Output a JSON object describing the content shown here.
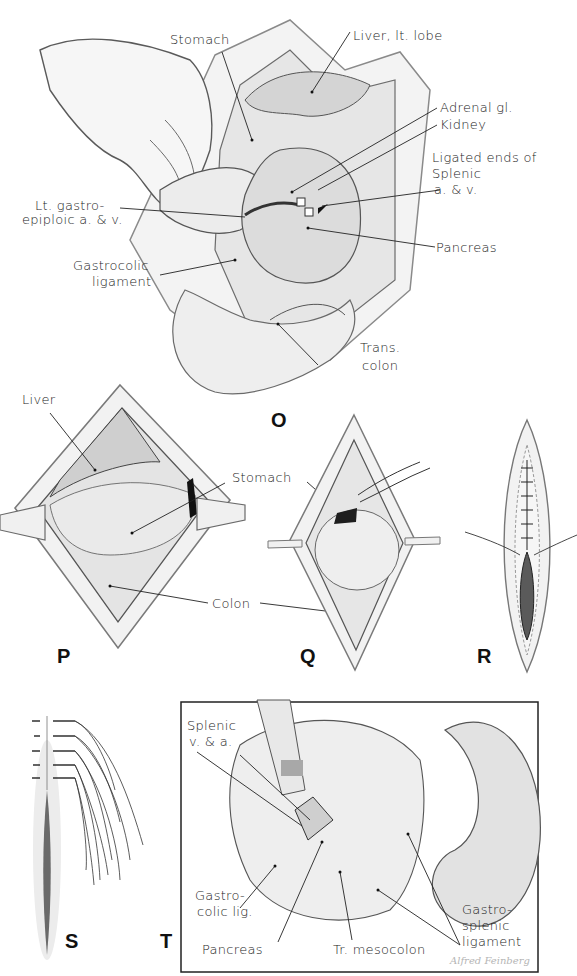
{
  "figure": {
    "panels": [
      {
        "id": "O",
        "letter": "O",
        "labels": {
          "stomach": "Stomach",
          "liver_lt_lobe": "Liver, lt. lobe",
          "adrenal_gl": "Adrenal gl.",
          "kidney": "Kidney",
          "ligated_ends_1": "Ligated ends of",
          "ligated_ends_2": "Splenic",
          "ligated_ends_3": "a. & v.",
          "lt_gastro_1": "Lt. gastro-",
          "lt_gastro_2": "epiploic a. & v.",
          "pancreas": "Pancreas",
          "gastrocolic_1": "Gastrocolic",
          "gastrocolic_2": "ligament",
          "trans_colon_1": "Trans.",
          "trans_colon_2": "colon"
        }
      },
      {
        "id": "P",
        "letter": "P",
        "labels": {
          "liver": "Liver",
          "stomach": "Stomach",
          "colon": "Colon"
        }
      },
      {
        "id": "Q",
        "letter": "Q"
      },
      {
        "id": "R",
        "letter": "R"
      },
      {
        "id": "S",
        "letter": "S"
      },
      {
        "id": "T",
        "letter": "T",
        "labels": {
          "splenic_1": "Splenic",
          "splenic_2": "v. & a.",
          "gastrocolic_1": "Gastro-",
          "gastrocolic_2": "colic lig.",
          "pancreas": "Pancreas",
          "tr_mesocolon": "Tr. mesocolon",
          "gastrosplenic_1": "Gastro-",
          "gastrosplenic_2": "splenic",
          "gastrosplenic_3": "ligament"
        },
        "signature": "Alfred Feinberg"
      }
    ]
  }
}
